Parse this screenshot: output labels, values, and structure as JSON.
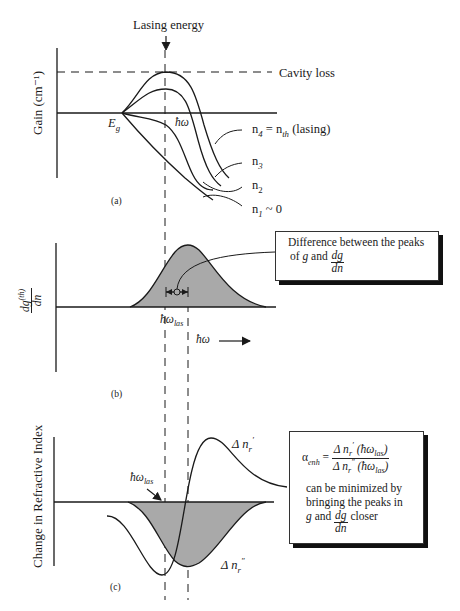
{
  "panel_a": {
    "caption": "(a)",
    "y_axis_label": "Gain (cm⁻¹)",
    "top_label": "Lasing energy",
    "cavity_loss_label": "Cavity loss",
    "band_gap_label": "E",
    "band_gap_sub": "g",
    "x_label": "ħω",
    "curves": [
      {
        "label": "n",
        "sub": "4",
        "suffix": " = n",
        "suffix_sub": "th",
        "tail": "  (lasing)"
      },
      {
        "label": "n",
        "sub": "3"
      },
      {
        "label": "n",
        "sub": "2"
      },
      {
        "label": "n",
        "sub": "1",
        "tail": " ~ 0"
      }
    ]
  },
  "panel_b": {
    "caption": "(b)",
    "y_axis_label_num": "dg",
    "y_axis_label_sup": "(th)",
    "y_axis_label_den": "dn",
    "peak_label": "ħω",
    "peak_label_sub": "las",
    "x_axis_label": "ħω",
    "callout": {
      "line1": "Difference between the peaks",
      "line2_prefix": "of ",
      "line2_g": "g",
      "line2_mid": " and ",
      "frac_num": "dg",
      "frac_den": "dn"
    }
  },
  "panel_c": {
    "caption": "(c)",
    "y_axis_label": "Change in Refractive Index",
    "pointer_label": "ħω",
    "pointer_label_sub": "las",
    "curve_real": {
      "prefix": "Δ n",
      "sub": "r",
      "sup": "′"
    },
    "curve_imag": {
      "prefix": "Δ n",
      "sub": "r",
      "sup": "″"
    },
    "formula_box": {
      "alpha": "α",
      "alpha_sub": "enh",
      "equals": " = ",
      "num": "Δ n",
      "num_sub": "r",
      "num_sup": "′",
      "num_arg": " (ħω",
      "num_arg_sub": "las",
      "num_arg_close": ")",
      "den": "Δ n",
      "den_sub": "r",
      "den_sup": "″",
      "den_arg": " (ħω",
      "den_arg_sub": "las",
      "den_arg_close": ")",
      "text1": "can be minimized by",
      "text2": "bringing the peaks in",
      "text3_g": "g",
      "text3_mid": " and ",
      "frac_num": "dg",
      "frac_den": "dn",
      "text3_end": " closer"
    }
  },
  "colors": {
    "ink": "#1a1a1a",
    "shade": "#a9a9a9",
    "background": "#ffffff"
  }
}
